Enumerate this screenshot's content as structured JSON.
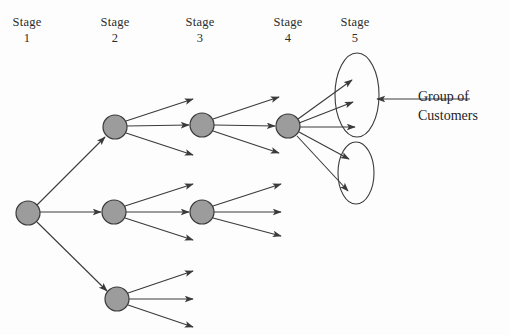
{
  "figure": {
    "type": "tree-diagram",
    "background_color": "#fdfdfd",
    "node_fill": "#9c9c9c",
    "node_stroke": "#3a3a3a",
    "line_color": "#3a3a3a",
    "text_color": "#2b2b2b"
  },
  "stages": [
    {
      "id": "stage-1",
      "word": "Stage",
      "number": "1",
      "cx": 27,
      "label_x": -3,
      "label_y": 14
    },
    {
      "id": "stage-2",
      "word": "Stage",
      "number": "2",
      "cx": 115,
      "label_x": 85,
      "label_y": 14
    },
    {
      "id": "stage-3",
      "word": "Stage",
      "number": "3",
      "cx": 200,
      "label_x": 170,
      "label_y": 14
    },
    {
      "id": "stage-4",
      "word": "Stage",
      "number": "4",
      "cx": 288,
      "label_x": 258,
      "label_y": 14
    },
    {
      "id": "stage-5",
      "word": "Stage",
      "number": "5",
      "cx": 355,
      "label_x": 325,
      "label_y": 14
    }
  ],
  "nodes": [
    {
      "id": "n1",
      "stage": 1,
      "cx": 28,
      "cy": 213,
      "r": 12
    },
    {
      "id": "n2a",
      "stage": 2,
      "cx": 115,
      "cy": 127,
      "r": 12
    },
    {
      "id": "n2b",
      "stage": 2,
      "cx": 114,
      "cy": 212,
      "r": 12
    },
    {
      "id": "n2c",
      "stage": 2,
      "cx": 117,
      "cy": 299,
      "r": 12
    },
    {
      "id": "n3a",
      "stage": 3,
      "cx": 202,
      "cy": 125,
      "r": 12
    },
    {
      "id": "n3b",
      "stage": 3,
      "cx": 202,
      "cy": 212,
      "r": 12
    },
    {
      "id": "n4a",
      "stage": 4,
      "cx": 288,
      "cy": 126,
      "r": 12
    }
  ],
  "groups": [
    {
      "id": "group-upper",
      "cx": 357,
      "cy": 95,
      "rx": 22,
      "ry": 42
    },
    {
      "id": "group-lower",
      "cx": 356,
      "cy": 173,
      "rx": 18,
      "ry": 31
    }
  ],
  "edges": [
    {
      "id": "e-n1-n2a",
      "from": "n1",
      "to": "n2a",
      "x1": 37,
      "y1": 205,
      "x2": 105,
      "y2": 137,
      "arrow": true
    },
    {
      "id": "e-n1-n2b",
      "from": "n1",
      "to": "n2b",
      "x1": 40,
      "y1": 212,
      "x2": 101,
      "y2": 212,
      "arrow": true
    },
    {
      "id": "e-n1-n2c",
      "from": "n1",
      "to": "n2c",
      "x1": 37,
      "y1": 222,
      "x2": 107,
      "y2": 291,
      "arrow": true
    },
    {
      "id": "e-n2a-up",
      "from": "n2a",
      "to": "open",
      "x1": 126,
      "y1": 121,
      "x2": 193,
      "y2": 99,
      "arrow": true
    },
    {
      "id": "e-n2a-n3a",
      "from": "n2a",
      "to": "n3a",
      "x1": 127,
      "y1": 126,
      "x2": 189,
      "y2": 125,
      "arrow": true
    },
    {
      "id": "e-n2a-dn",
      "from": "n2a",
      "to": "open",
      "x1": 126,
      "y1": 133,
      "x2": 193,
      "y2": 155,
      "arrow": true
    },
    {
      "id": "e-n2b-up",
      "from": "n2b",
      "to": "open",
      "x1": 125,
      "y1": 206,
      "x2": 193,
      "y2": 184,
      "arrow": true
    },
    {
      "id": "e-n2b-n3b",
      "from": "n2b",
      "to": "n3b",
      "x1": 126,
      "y1": 212,
      "x2": 189,
      "y2": 212,
      "arrow": true
    },
    {
      "id": "e-n2b-dn",
      "from": "n2b",
      "to": "open",
      "x1": 125,
      "y1": 218,
      "x2": 193,
      "y2": 240,
      "arrow": true
    },
    {
      "id": "e-n2c-up",
      "from": "n2c",
      "to": "open",
      "x1": 128,
      "y1": 293,
      "x2": 193,
      "y2": 271,
      "arrow": true
    },
    {
      "id": "e-n2c-mid",
      "from": "n2c",
      "to": "open",
      "x1": 129,
      "y1": 299,
      "x2": 193,
      "y2": 299,
      "arrow": true
    },
    {
      "id": "e-n2c-dn",
      "from": "n2c",
      "to": "open",
      "x1": 128,
      "y1": 305,
      "x2": 193,
      "y2": 327,
      "arrow": true
    },
    {
      "id": "e-n3a-up",
      "from": "n3a",
      "to": "open",
      "x1": 213,
      "y1": 119,
      "x2": 279,
      "y2": 97,
      "arrow": true
    },
    {
      "id": "e-n3a-n4a",
      "from": "n3a",
      "to": "n4a",
      "x1": 214,
      "y1": 125,
      "x2": 275,
      "y2": 126,
      "arrow": true
    },
    {
      "id": "e-n3a-dn",
      "from": "n3a",
      "to": "open",
      "x1": 213,
      "y1": 131,
      "x2": 279,
      "y2": 153,
      "arrow": true
    },
    {
      "id": "e-n3b-up",
      "from": "n3b",
      "to": "open",
      "x1": 213,
      "y1": 206,
      "x2": 281,
      "y2": 184,
      "arrow": true
    },
    {
      "id": "e-n3b-mid",
      "from": "n3b",
      "to": "open",
      "x1": 214,
      "y1": 212,
      "x2": 281,
      "y2": 212,
      "arrow": true
    },
    {
      "id": "e-n3b-dn",
      "from": "n3b",
      "to": "open",
      "x1": 213,
      "y1": 218,
      "x2": 281,
      "y2": 236,
      "arrow": true
    },
    {
      "id": "e-n4a-g1",
      "from": "n4a",
      "to": "group-upper",
      "x1": 298,
      "y1": 119,
      "x2": 352,
      "y2": 80,
      "arrow": true
    },
    {
      "id": "e-n4a-g2",
      "from": "n4a",
      "to": "group-upper",
      "x1": 299,
      "y1": 123,
      "x2": 353,
      "y2": 102,
      "arrow": true
    },
    {
      "id": "e-n4a-g3",
      "from": "n4a",
      "to": "group-upper",
      "x1": 300,
      "y1": 127,
      "x2": 355,
      "y2": 127,
      "arrow": true
    },
    {
      "id": "e-n4a-g4",
      "from": "n4a",
      "to": "group-lower",
      "x1": 299,
      "y1": 132,
      "x2": 349,
      "y2": 159,
      "arrow": true
    },
    {
      "id": "e-n4a-g5",
      "from": "n4a",
      "to": "group-lower",
      "x1": 297,
      "y1": 136,
      "x2": 348,
      "y2": 191,
      "arrow": true
    }
  ],
  "callout": {
    "id": "group-of-customers",
    "line1": "Group of",
    "line2": "Customers",
    "text_x": 418,
    "text_y": 88,
    "arrow": {
      "x1": 470,
      "y1": 99,
      "x2": 377,
      "y2": 99
    }
  }
}
